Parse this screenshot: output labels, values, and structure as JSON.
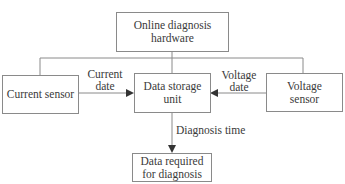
{
  "diagram": {
    "nodes": {
      "hardware": {
        "line1": "Online diagnosis",
        "line2": "hardware"
      },
      "current_sensor": {
        "label": "Current sensor"
      },
      "storage": {
        "line1": "Data storage",
        "line2": "unit"
      },
      "voltage_sensor": {
        "line1": "Voltage",
        "line2": "sensor"
      },
      "required": {
        "line1": "Data required",
        "line2": "for diagnosis"
      }
    },
    "edges": {
      "current": {
        "line1": "Current",
        "line2": "date"
      },
      "voltage": {
        "line1": "Voltage",
        "line2": "date"
      },
      "diagnosis": {
        "label": "Diagnosis time"
      }
    },
    "colors": {
      "line": "#8a8a8a",
      "arrow": "#333333",
      "text": "#3a3a3a"
    }
  }
}
